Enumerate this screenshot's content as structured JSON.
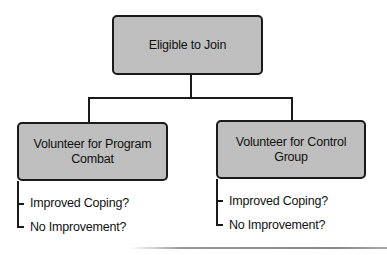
{
  "diagram": {
    "root": {
      "label": "Eligible to Join"
    },
    "branches": [
      {
        "label": "Volunteer for Program Combat",
        "outcomes": [
          "Improved Coping?",
          "No Improvement?"
        ]
      },
      {
        "label": "Volunteer for Control Group",
        "outcomes": [
          "Improved Coping?",
          "No Improvement?"
        ]
      }
    ],
    "colors": {
      "box_fill": "#c8c8c8",
      "stroke": "#1a1a1a",
      "background": "#ffffff"
    }
  }
}
